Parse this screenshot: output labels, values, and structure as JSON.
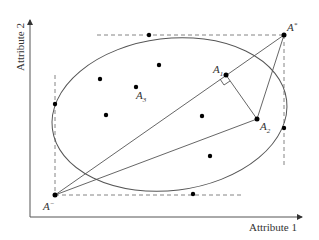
{
  "diagram": {
    "axes": {
      "x_label": "Attribute 1",
      "y_label": "Attribute 2"
    },
    "labels": {
      "a_star": "A",
      "a_star_sup": "*",
      "a_minus": "A",
      "a_minus_sup": "−",
      "a1": "A",
      "a1_sub": "1",
      "a2": "A",
      "a2_sub": "2",
      "a3": "A",
      "a3_sub": "3"
    },
    "points": [
      {
        "name": "A*",
        "x": 284,
        "y": 35
      },
      {
        "name": "A-",
        "x": 55,
        "y": 195
      },
      {
        "name": "A1",
        "x": 226,
        "y": 75
      },
      {
        "name": "A2",
        "x": 257,
        "y": 119
      },
      {
        "name": "A3",
        "x": 136,
        "y": 87
      },
      {
        "name": "top-tangent",
        "x": 149,
        "y": 35
      },
      {
        "name": "left-tangent",
        "x": 55,
        "y": 104
      },
      {
        "name": "right-tangent",
        "x": 284,
        "y": 128
      },
      {
        "name": "bottom-tangent",
        "x": 193,
        "y": 194
      },
      {
        "name": "p1",
        "x": 100,
        "y": 79
      },
      {
        "name": "p2",
        "x": 159,
        "y": 65
      },
      {
        "name": "p3",
        "x": 106,
        "y": 115
      },
      {
        "name": "p4",
        "x": 202,
        "y": 116
      },
      {
        "name": "p5",
        "x": 210,
        "y": 156
      }
    ],
    "colors": {
      "line": "#555555",
      "point": "#000000",
      "dash": "#777777"
    }
  }
}
